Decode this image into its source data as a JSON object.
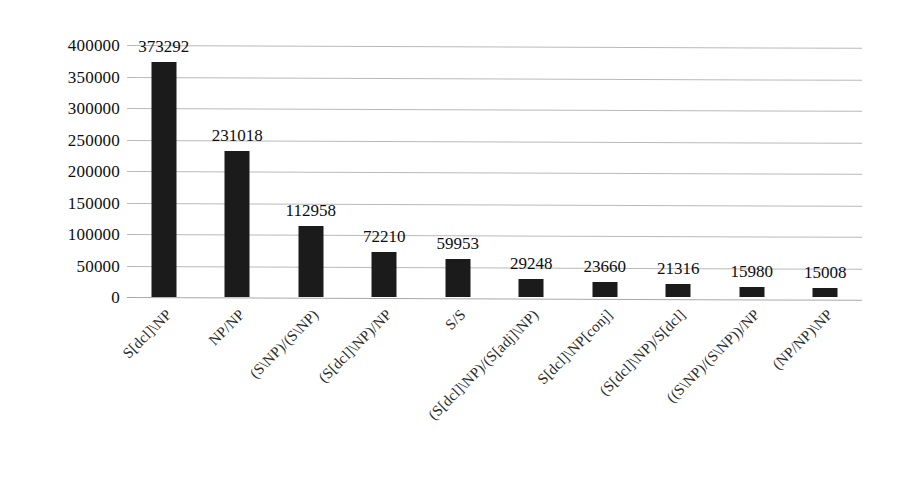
{
  "chart_data": {
    "type": "bar",
    "title": "",
    "subtitle": "",
    "xlabel": "",
    "ylabel": "",
    "ylim": [
      0,
      400000
    ],
    "ytick_step": 50000,
    "grid": true,
    "legend": false,
    "orientation": "vertical",
    "bar_color": "#1b1b1b",
    "gridline_color": "#b9b9b9",
    "yticks": [
      "400000",
      "350000",
      "300000",
      "250000",
      "200000",
      "150000",
      "100000",
      "50000",
      "0"
    ],
    "ytick_values": [
      400000,
      350000,
      300000,
      250000,
      200000,
      150000,
      100000,
      50000,
      0
    ],
    "categories": [
      "S[dcl]\\NP",
      "NP/NP",
      "(S\\NP)/(S\\NP)",
      "(S[dcl]\\NP)/NP",
      "S/S",
      "(S[dcl]\\NP)/(S[adj]\\NP)",
      "S[dcl]\\NP[conj]",
      "(S[dcl]\\NP)/S[dcl]",
      "((S\\NP)/(S\\NP))/NP",
      "(NP/NP)\\NP"
    ],
    "values": [
      373292,
      231018,
      112958,
      72210,
      59953,
      29248,
      23660,
      21316,
      15980,
      15008
    ],
    "value_labels": [
      "373292",
      "231018",
      "112958",
      "72210",
      "59953",
      "29248",
      "23660",
      "21316",
      "15980",
      "15008"
    ]
  }
}
